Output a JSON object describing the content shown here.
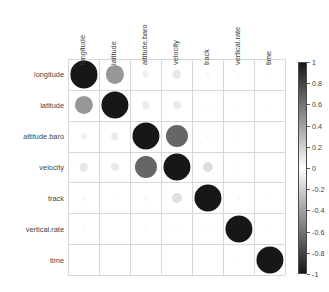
{
  "chart_data": {
    "type": "heatmap",
    "title": "",
    "subtitle": "",
    "xlabel": "",
    "ylabel": "",
    "variables": [
      "longitude",
      "latitude",
      "altitude.baro",
      "velocity",
      "track",
      "vertical.rate",
      "time"
    ],
    "categories": [
      "longitude",
      "latitude",
      "altitude.baro",
      "velocity",
      "track",
      "vertical.rate",
      "time"
    ],
    "matrix": [
      [
        1.0,
        0.45,
        0.06,
        0.1,
        0.03,
        0.02,
        0.01
      ],
      [
        0.45,
        1.0,
        0.08,
        0.09,
        0.02,
        0.01,
        0.01
      ],
      [
        0.06,
        0.08,
        1.0,
        0.66,
        0.03,
        0.02,
        0.01
      ],
      [
        0.1,
        0.09,
        0.66,
        1.0,
        0.14,
        0.02,
        0.01
      ],
      [
        0.03,
        0.02,
        0.03,
        0.14,
        1.0,
        0.02,
        0.01
      ],
      [
        0.02,
        0.01,
        0.02,
        0.02,
        0.02,
        1.0,
        0.02
      ],
      [
        0.01,
        0.01,
        0.01,
        0.01,
        0.01,
        0.02,
        1.0
      ]
    ],
    "legend": {
      "position": "right",
      "orientation": "vertical",
      "min": -1,
      "max": 1,
      "ticks": [
        "1",
        "0.8",
        "0.6",
        "0.4",
        "0.2",
        "0",
        "-0.2",
        "-0.4",
        "-0.6",
        "-0.8",
        "-1"
      ],
      "tick_values": [
        1,
        0.8,
        0.6,
        0.4,
        0.2,
        0,
        -0.2,
        -0.4,
        -0.6,
        -0.8,
        -1
      ]
    },
    "colors": {
      "positive_extreme": "#1a1a1a",
      "zero": "#ffffff",
      "negative_extreme": "#1a1a1a",
      "grid": "#d8d8d8",
      "text": "#3f3f3f"
    },
    "grid": true,
    "shape": "circle",
    "circle_size_encodes": "absolute correlation"
  }
}
